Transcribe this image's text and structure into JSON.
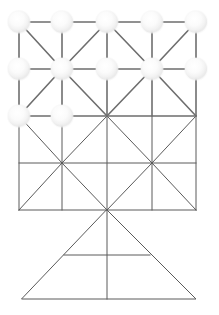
{
  "figure": {
    "width": 219,
    "height": 315,
    "background_color": "#ffffff"
  },
  "style": {
    "edge_color": "#6e6e6e",
    "edge_width": 1.6,
    "wire_color": "#5a5a5a",
    "wire_width": 1.0,
    "node_light_fill": "#ffffff",
    "node_light_glow": "#e9e9e9",
    "node_light_edge": "#d8d8d8",
    "node_dark_fill": "#1b1b1b",
    "node_dark_highlight": "#b8b8b8",
    "node_dark_edge": "#000000",
    "node_radius": 11,
    "node_dark_radius": 10.5
  },
  "lattice": {
    "columns_x": [
      19,
      62,
      107,
      152,
      196
    ],
    "rows_y": [
      22,
      69,
      116
    ],
    "nodes": [
      {
        "id": "n-0-0",
        "col": 0,
        "row": 0,
        "x": 19,
        "y": 22,
        "kind": "light",
        "label": "node-r0-c0"
      },
      {
        "id": "n-0-1",
        "col": 1,
        "row": 0,
        "x": 62,
        "y": 22,
        "kind": "light",
        "label": "node-r0-c1"
      },
      {
        "id": "n-0-2",
        "col": 2,
        "row": 0,
        "x": 107,
        "y": 22,
        "kind": "light",
        "label": "node-r0-c2"
      },
      {
        "id": "n-0-3",
        "col": 3,
        "row": 0,
        "x": 152,
        "y": 22,
        "kind": "light",
        "label": "node-r0-c3"
      },
      {
        "id": "n-0-4",
        "col": 4,
        "row": 0,
        "x": 196,
        "y": 22,
        "kind": "light",
        "label": "node-r0-c4"
      },
      {
        "id": "n-1-0",
        "col": 0,
        "row": 1,
        "x": 19,
        "y": 69,
        "kind": "light",
        "label": "node-r1-c0"
      },
      {
        "id": "n-1-1",
        "col": 1,
        "row": 1,
        "x": 62,
        "y": 69,
        "kind": "light",
        "label": "node-r1-c1"
      },
      {
        "id": "n-1-2",
        "col": 2,
        "row": 1,
        "x": 107,
        "y": 69,
        "kind": "light",
        "label": "node-r1-c2"
      },
      {
        "id": "n-1-3",
        "col": 3,
        "row": 1,
        "x": 152,
        "y": 69,
        "kind": "light",
        "label": "node-r1-c3"
      },
      {
        "id": "n-1-4",
        "col": 4,
        "row": 1,
        "x": 196,
        "y": 69,
        "kind": "light",
        "label": "node-r1-c4"
      },
      {
        "id": "n-2-0",
        "col": 0,
        "row": 2,
        "x": 19,
        "y": 116,
        "kind": "light",
        "label": "node-r2-c0"
      },
      {
        "id": "n-2-1",
        "col": 1,
        "row": 2,
        "x": 62,
        "y": 116,
        "kind": "light",
        "label": "node-r2-c1"
      },
      {
        "id": "n-2-2",
        "col": 2,
        "row": 2,
        "x": 107,
        "y": 116,
        "kind": "dark",
        "label": "node-r2-c2-selected"
      },
      {
        "id": "n-2-3",
        "col": 3,
        "row": 2,
        "x": 152,
        "y": 116,
        "kind": "light",
        "label": "node-r2-c3"
      },
      {
        "id": "n-2-4",
        "col": 4,
        "row": 2,
        "x": 196,
        "y": 116,
        "kind": "light",
        "label": "node-r2-c4"
      }
    ],
    "edges_horizontal": [
      {
        "x1": 19,
        "y1": 22,
        "x2": 196,
        "y2": 22
      },
      {
        "x1": 19,
        "y1": 69,
        "x2": 196,
        "y2": 69
      },
      {
        "x1": 19,
        "y1": 116,
        "x2": 196,
        "y2": 116
      }
    ],
    "edges_vertical": [
      {
        "x1": 19,
        "y1": 22,
        "x2": 19,
        "y2": 116
      },
      {
        "x1": 62,
        "y1": 22,
        "x2": 62,
        "y2": 116
      },
      {
        "x1": 107,
        "y1": 22,
        "x2": 107,
        "y2": 116
      },
      {
        "x1": 152,
        "y1": 22,
        "x2": 152,
        "y2": 116
      },
      {
        "x1": 196,
        "y1": 22,
        "x2": 196,
        "y2": 116
      }
    ],
    "edges_diagonal": [
      {
        "x1": 19,
        "y1": 22,
        "x2": 62,
        "y2": 69
      },
      {
        "x1": 107,
        "y1": 22,
        "x2": 62,
        "y2": 69
      },
      {
        "x1": 19,
        "y1": 116,
        "x2": 62,
        "y2": 69
      },
      {
        "x1": 107,
        "y1": 116,
        "x2": 62,
        "y2": 69
      },
      {
        "x1": 107,
        "y1": 22,
        "x2": 152,
        "y2": 69
      },
      {
        "x1": 196,
        "y1": 22,
        "x2": 152,
        "y2": 69
      },
      {
        "x1": 107,
        "y1": 116,
        "x2": 152,
        "y2": 69
      },
      {
        "x1": 196,
        "y1": 116,
        "x2": 152,
        "y2": 69
      }
    ]
  },
  "wireframe": {
    "grid_rows_y": [
      116,
      163,
      210
    ],
    "grid_cols_x": [
      19,
      62,
      107,
      152,
      196
    ],
    "horizontals": [
      {
        "x1": 19,
        "y1": 163,
        "x2": 196,
        "y2": 163
      },
      {
        "x1": 19,
        "y1": 210,
        "x2": 196,
        "y2": 210
      }
    ],
    "verticals": [
      {
        "x1": 19,
        "y1": 116,
        "x2": 19,
        "y2": 210
      },
      {
        "x1": 62,
        "y1": 116,
        "x2": 62,
        "y2": 210
      },
      {
        "x1": 107,
        "y1": 116,
        "x2": 107,
        "y2": 210
      },
      {
        "x1": 152,
        "y1": 116,
        "x2": 152,
        "y2": 210
      },
      {
        "x1": 196,
        "y1": 116,
        "x2": 196,
        "y2": 210
      }
    ],
    "diagonals": [
      {
        "x1": 19,
        "y1": 116,
        "x2": 62,
        "y2": 163
      },
      {
        "x1": 107,
        "y1": 116,
        "x2": 62,
        "y2": 163
      },
      {
        "x1": 19,
        "y1": 210,
        "x2": 62,
        "y2": 163
      },
      {
        "x1": 107,
        "y1": 210,
        "x2": 62,
        "y2": 163
      },
      {
        "x1": 107,
        "y1": 116,
        "x2": 152,
        "y2": 163
      },
      {
        "x1": 196,
        "y1": 116,
        "x2": 152,
        "y2": 163
      },
      {
        "x1": 107,
        "y1": 210,
        "x2": 152,
        "y2": 163
      },
      {
        "x1": 196,
        "y1": 210,
        "x2": 152,
        "y2": 163
      }
    ]
  },
  "base_triangle": {
    "apex": {
      "x": 107,
      "y": 210
    },
    "base_left": {
      "x": 22,
      "y": 299
    },
    "base_right": {
      "x": 196,
      "y": 299
    },
    "centerline": {
      "x1": 107,
      "y1": 210,
      "x2": 107,
      "y2": 299
    },
    "crossbar": {
      "x1": 64,
      "y1": 255,
      "x2": 150,
      "y2": 255
    },
    "outline_closed": true
  },
  "legend": {
    "light_node_meaning": "unselected lattice node",
    "dark_node_meaning": "selected / highlighted node"
  }
}
